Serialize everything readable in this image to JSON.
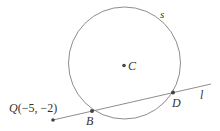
{
  "diagram": {
    "circle": {
      "name": "s",
      "center_label": "C"
    },
    "line": {
      "name": "l"
    },
    "points": {
      "Q": {
        "label": "Q",
        "coords": "(−5, −2)"
      },
      "B": {
        "label": "B"
      },
      "D": {
        "label": "D"
      },
      "C": {
        "label": "C"
      }
    },
    "colors": {
      "stroke": "#777777",
      "point": "#444444",
      "text": "#333333"
    }
  }
}
